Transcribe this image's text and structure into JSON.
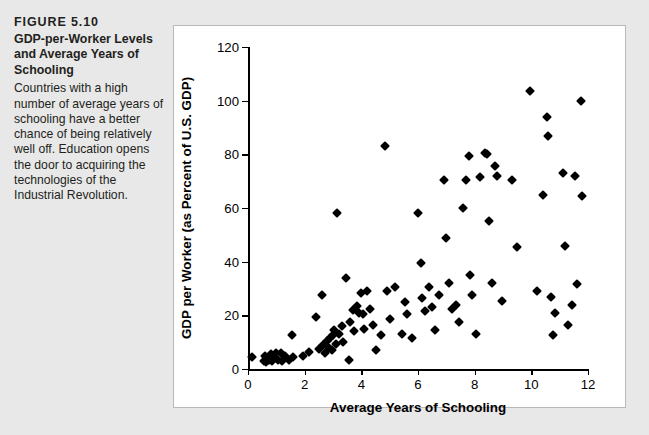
{
  "figure": {
    "number": "FIGURE 5.10",
    "title": "GDP-per-Worker Levels and Average Years of Schooling",
    "description": "Countries with a high number of average years of schooling have a better chance of being relatively well off. Education opens the door to acquiring the technologies of the Industrial Revolution.",
    "source_note": ""
  },
  "colors": {
    "page_background": "#e8e8e8",
    "panel_background": "#ffffff",
    "panel_border": "#b9b9b9",
    "axis": "#000000",
    "marker": "#000000",
    "text": "#231f20"
  },
  "chart_data": {
    "type": "scatter",
    "title": "",
    "xlabel": "Average Years of Schooling",
    "ylabel": "GDP per Worker (as Percent of U.S. GDP)",
    "xlim": [
      0,
      12
    ],
    "ylim": [
      0,
      120
    ],
    "xticks": [
      0,
      2,
      4,
      6,
      8,
      10,
      12
    ],
    "yticks": [
      0,
      20,
      40,
      60,
      80,
      100,
      120
    ],
    "xtick_labels": [
      "0",
      "2",
      "4",
      "6",
      "8",
      "10",
      "12"
    ],
    "ytick_labels": [
      "0",
      "20",
      "40",
      "60",
      "80",
      "100",
      "120"
    ],
    "grid": false,
    "legend": null,
    "marker": "diamond",
    "series": [
      {
        "name": "Countries",
        "points": [
          [
            0.15,
            4.5
          ],
          [
            0.55,
            3.0
          ],
          [
            0.6,
            5.0
          ],
          [
            0.65,
            2.5
          ],
          [
            0.7,
            4.0
          ],
          [
            0.75,
            3.3
          ],
          [
            0.8,
            5.5
          ],
          [
            0.85,
            2.8
          ],
          [
            0.9,
            4.2
          ],
          [
            1.0,
            6.0
          ],
          [
            1.05,
            3.5
          ],
          [
            1.15,
            5.8
          ],
          [
            1.2,
            3.0
          ],
          [
            1.3,
            4.8
          ],
          [
            1.45,
            3.2
          ],
          [
            1.55,
            12.5
          ],
          [
            1.6,
            4.5
          ],
          [
            1.95,
            5.0
          ],
          [
            2.15,
            6.5
          ],
          [
            2.4,
            19.5
          ],
          [
            2.5,
            7.5
          ],
          [
            2.6,
            27.5
          ],
          [
            2.65,
            9.0
          ],
          [
            2.7,
            6.0
          ],
          [
            2.8,
            10.5
          ],
          [
            2.85,
            8.0
          ],
          [
            2.9,
            11.5
          ],
          [
            2.95,
            7.0
          ],
          [
            3.0,
            12.5
          ],
          [
            3.05,
            14.5
          ],
          [
            3.1,
            9.5
          ],
          [
            3.15,
            58.0
          ],
          [
            3.2,
            13.0
          ],
          [
            3.3,
            16.0
          ],
          [
            3.35,
            10.0
          ],
          [
            3.45,
            34.0
          ],
          [
            3.55,
            3.5
          ],
          [
            3.6,
            17.5
          ],
          [
            3.7,
            22.0
          ],
          [
            3.75,
            14.0
          ],
          [
            3.85,
            23.5
          ],
          [
            3.9,
            21.0
          ],
          [
            4.0,
            28.5
          ],
          [
            4.05,
            20.5
          ],
          [
            4.1,
            15.0
          ],
          [
            4.2,
            29.0
          ],
          [
            4.3,
            22.5
          ],
          [
            4.4,
            16.5
          ],
          [
            4.5,
            7.0
          ],
          [
            4.7,
            12.5
          ],
          [
            4.85,
            83.0
          ],
          [
            4.9,
            29.0
          ],
          [
            5.0,
            18.5
          ],
          [
            5.2,
            30.5
          ],
          [
            5.45,
            13.0
          ],
          [
            5.55,
            25.0
          ],
          [
            5.6,
            20.5
          ],
          [
            5.8,
            11.5
          ],
          [
            6.0,
            58.0
          ],
          [
            6.1,
            39.5
          ],
          [
            6.15,
            26.5
          ],
          [
            6.25,
            21.5
          ],
          [
            6.4,
            30.5
          ],
          [
            6.5,
            23.0
          ],
          [
            6.6,
            14.5
          ],
          [
            6.75,
            27.5
          ],
          [
            6.9,
            70.5
          ],
          [
            7.0,
            49.0
          ],
          [
            7.1,
            32.0
          ],
          [
            7.2,
            22.5
          ],
          [
            7.35,
            24.0
          ],
          [
            7.45,
            17.5
          ],
          [
            7.6,
            60.0
          ],
          [
            7.7,
            70.5
          ],
          [
            7.8,
            79.5
          ],
          [
            7.85,
            35.0
          ],
          [
            7.9,
            27.5
          ],
          [
            8.05,
            13.0
          ],
          [
            8.2,
            71.5
          ],
          [
            8.35,
            80.5
          ],
          [
            8.45,
            80.0
          ],
          [
            8.5,
            55.0
          ],
          [
            8.6,
            32.0
          ],
          [
            8.7,
            75.5
          ],
          [
            8.8,
            72.0
          ],
          [
            8.95,
            25.5
          ],
          [
            9.3,
            70.5
          ],
          [
            9.5,
            45.5
          ],
          [
            9.95,
            103.5
          ],
          [
            10.2,
            29.0
          ],
          [
            10.4,
            65.0
          ],
          [
            10.55,
            94.0
          ],
          [
            10.6,
            87.0
          ],
          [
            10.7,
            27.0
          ],
          [
            10.75,
            12.5
          ],
          [
            10.85,
            21.0
          ],
          [
            11.1,
            73.0
          ],
          [
            11.2,
            46.0
          ],
          [
            11.3,
            16.5
          ],
          [
            11.45,
            24.0
          ],
          [
            11.55,
            72.0
          ],
          [
            11.6,
            31.5
          ],
          [
            11.75,
            100.0
          ],
          [
            11.8,
            64.5
          ]
        ]
      }
    ]
  }
}
